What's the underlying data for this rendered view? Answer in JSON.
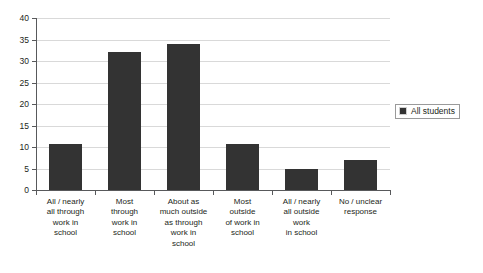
{
  "chart_data": {
    "type": "bar",
    "title": "",
    "xlabel": "",
    "ylabel": "",
    "ylim": [
      0,
      40
    ],
    "yticks": [
      0,
      5,
      10,
      15,
      20,
      25,
      30,
      35,
      40
    ],
    "grid": true,
    "legend_position": "right",
    "categories": [
      "All / nearly all through work in school",
      "Most through work in school",
      "About as much outside as through work in school",
      "Most outside of work in school",
      "All / nearly all outside work in school",
      "No / unclear response"
    ],
    "category_lines": [
      [
        "All / nearly",
        "all through",
        "work in",
        "school"
      ],
      [
        "Most",
        "through",
        "work in",
        "school"
      ],
      [
        "About as",
        "much outside",
        "as through",
        "work in",
        "school"
      ],
      [
        "Most",
        "outside",
        "of work in",
        "school"
      ],
      [
        "All / nearly",
        "all outside",
        "work",
        "in school"
      ],
      [
        "No / unclear",
        "response"
      ]
    ],
    "series": [
      {
        "name": "All students",
        "color": "#333333",
        "values": [
          10.7,
          32,
          34,
          10.7,
          5,
          7
        ]
      }
    ]
  },
  "legend": {
    "items": [
      {
        "label": "All students",
        "color": "#333333"
      }
    ]
  },
  "axis": {
    "y_tick_labels": [
      "0",
      "5",
      "10",
      "15",
      "20",
      "25",
      "30",
      "35",
      "40"
    ]
  }
}
